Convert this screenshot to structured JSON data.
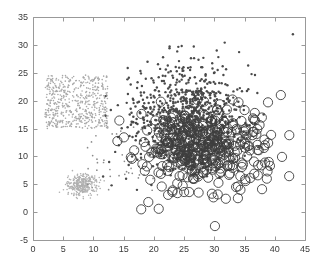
{
  "figure": {
    "background_color": "#ffffff",
    "axis_color": "#999999",
    "tick_label_color": "#3a3a3a",
    "width": 324,
    "height": 265
  },
  "chart_data": {
    "type": "scatter",
    "title": "",
    "xlabel": "",
    "ylabel": "",
    "xlim": [
      0,
      45
    ],
    "ylim": [
      -5,
      35
    ],
    "xticks": [
      0,
      5,
      10,
      15,
      20,
      25,
      30,
      35,
      40,
      45
    ],
    "yticks": [
      -5,
      0,
      5,
      10,
      15,
      20,
      25,
      30,
      35
    ],
    "xtick_labels": [
      "0",
      "5",
      "10",
      "15",
      "20",
      "25",
      "30",
      "35",
      "40",
      "45"
    ],
    "ytick_labels": [
      "-5",
      "0",
      "5",
      "10",
      "15",
      "20",
      "25",
      "30",
      "35"
    ],
    "grid": false,
    "legend": null,
    "plot_box": {
      "left_px": 33,
      "top_px": 17,
      "right_px": 305,
      "bottom_px": 240
    },
    "series": [
      {
        "name": "uniform-square-cluster",
        "marker": "dot",
        "filled": true,
        "color": "#a8a8a8",
        "size_px": 1.6,
        "distribution": "uniform",
        "x_range": [
          2.0,
          12.4
        ],
        "y_range": [
          15.0,
          24.6
        ],
        "count": 560,
        "seed": 17
      },
      {
        "name": "lower-left-gaussian-cluster",
        "marker": "dot",
        "filled": true,
        "color": "#b0b0b0",
        "size_px": 1.6,
        "distribution": "gaussian",
        "center": [
          8.3,
          5.0
        ],
        "sigma": [
          1.15,
          0.95
        ],
        "count": 320,
        "seed": 29
      },
      {
        "name": "sparse-bridge-scatter",
        "marker": "dot",
        "filled": true,
        "color": "#8a8a8a",
        "size_px": 1.7,
        "distribution": "uniform",
        "x_range": [
          9.0,
          20.0
        ],
        "y_range": [
          3.5,
          16.0
        ],
        "count": 46,
        "seed": 41
      },
      {
        "name": "dark-filled-dot-cluster",
        "marker": "dot",
        "filled": true,
        "color": "#4a4a4a",
        "size_px": 2.5,
        "distribution": "gaussian",
        "center": [
          26.0,
          15.0
        ],
        "sigma": [
          4.4,
          3.4
        ],
        "count": 700,
        "seed": 7
      },
      {
        "name": "dark-dot-upper-sparse-halo",
        "marker": "dot",
        "filled": true,
        "color": "#4a4a4a",
        "size_px": 2.4,
        "distribution": "gaussian",
        "center": [
          25.5,
          21.5
        ],
        "sigma": [
          5.0,
          3.0
        ],
        "count": 220,
        "seed": 13
      },
      {
        "name": "dark-dot-outliers",
        "marker": "dot",
        "filled": true,
        "color": "#4a4a4a",
        "size_px": 2.4,
        "points": [
          [
            22.6,
            29.7
          ],
          [
            24.6,
            29.8
          ],
          [
            26.6,
            29.7
          ],
          [
            30.4,
            29.0
          ],
          [
            34.1,
            28.7
          ],
          [
            35.6,
            26.3
          ],
          [
            43.0,
            31.9
          ],
          [
            22.3,
            26.3
          ],
          [
            24.9,
            26.0
          ],
          [
            28.0,
            26.0
          ],
          [
            19.9,
            23.6
          ],
          [
            20.8,
            24.2
          ],
          [
            17.3,
            23.3
          ],
          [
            31.5,
            24.6
          ],
          [
            33.8,
            22.0
          ],
          [
            18.2,
            19.0
          ],
          [
            16.0,
            17.5
          ],
          [
            14.2,
            12.0
          ],
          [
            13.6,
            10.8
          ],
          [
            12.6,
            9.0
          ],
          [
            15.4,
            6.0
          ],
          [
            17.2,
            4.0
          ],
          [
            13.0,
            4.8
          ],
          [
            11.6,
            6.4
          ]
        ]
      },
      {
        "name": "open-circle-cluster",
        "marker": "circle",
        "filled": false,
        "color": "#3d3d3d",
        "size_px": 4.6,
        "stroke_px": 0.9,
        "distribution": "gaussian",
        "center": [
          28.0,
          11.2
        ],
        "sigma": [
          5.0,
          3.7
        ],
        "count": 330,
        "seed": 23
      },
      {
        "name": "open-circle-outliers",
        "marker": "circle",
        "filled": false,
        "color": "#3d3d3d",
        "size_px": 4.6,
        "stroke_px": 0.9,
        "points": [
          [
            17.9,
            0.5
          ],
          [
            20.8,
            0.6
          ],
          [
            30.1,
            -2.5
          ],
          [
            41.0,
            21.0
          ],
          [
            42.4,
            13.8
          ],
          [
            38.9,
            12.4
          ],
          [
            39.0,
            9.0
          ],
          [
            38.8,
            7.3
          ],
          [
            37.2,
            6.6
          ],
          [
            35.1,
            5.9
          ],
          [
            33.6,
            4.5
          ],
          [
            31.9,
            2.4
          ],
          [
            33.9,
            2.5
          ],
          [
            29.6,
            3.3
          ],
          [
            27.4,
            3.5
          ],
          [
            25.0,
            3.6
          ],
          [
            23.1,
            3.9
          ],
          [
            21.3,
            4.6
          ],
          [
            19.4,
            5.8
          ],
          [
            18.5,
            7.4
          ],
          [
            18.1,
            8.6
          ],
          [
            19.2,
            9.9
          ],
          [
            34.0,
            19.7
          ],
          [
            35.0,
            18.3
          ],
          [
            36.6,
            16.6
          ],
          [
            37.1,
            14.9
          ],
          [
            35.2,
            15.0
          ],
          [
            33.0,
            20.2
          ]
        ]
      }
    ]
  }
}
